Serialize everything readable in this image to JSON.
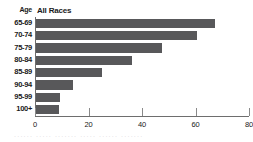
{
  "chart_data": {
    "type": "bar",
    "orientation": "horizontal",
    "title": "",
    "series_header": "All Races",
    "category_header": "Age",
    "categories": [
      "65-69",
      "70-74",
      "75-79",
      "80-84",
      "85-89",
      "90-94",
      "95-99",
      "100+"
    ],
    "values": [
      67,
      60,
      47,
      36,
      24.5,
      14,
      9,
      8.5
    ],
    "xlabel": "",
    "ylabel": "Age",
    "xlim": [
      0,
      80
    ],
    "xticks": [
      0,
      20,
      40,
      60,
      80
    ],
    "xtick_labels": [
      "0",
      "20",
      "40",
      "60",
      "80"
    ],
    "grid": false,
    "legend": "none",
    "bar_color": "#58585a",
    "axis_color": "#6e6e6e"
  },
  "footer": {
    "smudge_text": "······  ·····  ·······  ·····  ······  ·······"
  }
}
